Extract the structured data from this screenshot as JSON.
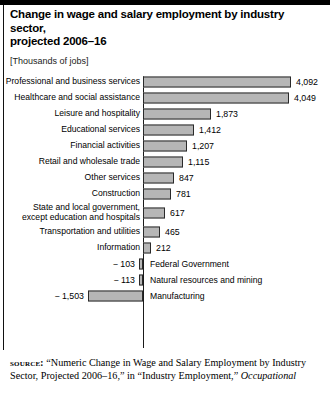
{
  "header": {
    "title": "Change in wage and salary employment by industry sector,\nprojected 2006–16",
    "subtitle": "[Thousands of jobs]"
  },
  "source": {
    "label": "source:",
    "text": " “Numeric Change in Wage and Salary Employment by Industry Sector, Projected 2006–16,” in “Industry Employment,” ",
    "italic": "Occupational"
  },
  "chart_data": {
    "type": "bar",
    "orientation": "horizontal",
    "title": "Change in wage and salary employment by industry sector, projected 2006–16",
    "subtitle": "[Thousands of jobs]",
    "xlabel": "",
    "ylabel": "",
    "units": "Thousands of jobs",
    "grid": false,
    "legend": false,
    "xlim": [
      -1503,
      4092
    ],
    "bar_color": "#b6b6b6",
    "bar_border_color": "#2a2a2a",
    "categories": [
      "Professional and business services",
      "Healthcare and social assistance",
      "Leisure and hospitality",
      "Educational services",
      "Financial activities",
      "Retail and wholesale trade",
      "Other services",
      "Construction",
      "State and local government,\nexcept education and hospitals",
      "Transportation and utilities",
      "Information",
      "Federal Government",
      "Natural resources and mining",
      "Manufacturing"
    ],
    "values": [
      4092,
      4049,
      1873,
      1412,
      1207,
      1115,
      847,
      781,
      617,
      465,
      212,
      -103,
      -113,
      -1503
    ],
    "value_labels": [
      "4,092",
      "4,049",
      "1,873",
      "1,412",
      "1,207",
      "1,115",
      "847",
      "781",
      "617",
      "465",
      "212",
      "− 103",
      "− 113",
      "− 1,503"
    ]
  }
}
